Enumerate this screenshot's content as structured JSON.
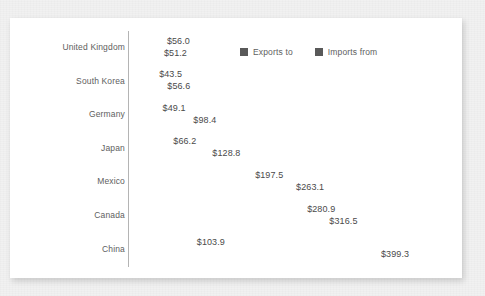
{
  "chart_data": {
    "type": "bar",
    "orientation": "horizontal",
    "title": "",
    "subtitle": "",
    "xlabel": "",
    "ylabel": "",
    "grid": false,
    "legend_position": "top-right",
    "axis_tick_labels_shown": false,
    "value_prefix": "$",
    "xlim": [
      0,
      399.3
    ],
    "categories": [
      "United Kingdom",
      "South Korea",
      "Germany",
      "Japan",
      "Mexico",
      "Canada",
      "China"
    ],
    "series": [
      {
        "name": "Exports to",
        "color": "#595959",
        "values": [
          56.0,
          43.5,
          49.1,
          66.2,
          197.5,
          280.9,
          103.9
        ],
        "labels": [
          "$56.0",
          "$43.5",
          "$49.1",
          "$66.2",
          "$197.5",
          "$280.9",
          "$103.9"
        ]
      },
      {
        "name": "Imports from",
        "color": "#595959",
        "values": [
          51.2,
          56.6,
          98.4,
          128.8,
          263.1,
          316.5,
          399.3
        ],
        "labels": [
          "$51.2",
          "$56.6",
          "$98.4",
          "$128.8",
          "$263.1",
          "$316.5",
          "$399.3"
        ]
      }
    ]
  },
  "legend": {
    "entries": [
      {
        "label": "Exports to",
        "swatch_name": "legend-swatch-exports"
      },
      {
        "label": "Imports from",
        "swatch_name": "legend-swatch-imports"
      }
    ]
  },
  "colors": {
    "bar": "#595959",
    "axis_line": "#b4b4b4",
    "panel_background": "#ffffff",
    "page_background": "#f1f1f1",
    "label_text": "#5e5e5e",
    "value_text": "#4a4a4a"
  }
}
